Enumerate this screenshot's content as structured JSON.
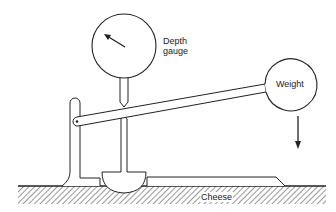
{
  "diagram": {
    "labels": {
      "depth_gauge_line1": "Depth",
      "depth_gauge_line2": "gauge",
      "weight": "Weight",
      "cheese": "Cheese"
    },
    "components": [
      {
        "name": "depth-gauge",
        "shape": "circle with needle"
      },
      {
        "name": "gauge-stem",
        "shape": "vertical rod"
      },
      {
        "name": "lever-arm",
        "shape": "inclined bar"
      },
      {
        "name": "weight",
        "shape": "circle"
      },
      {
        "name": "pivot-post",
        "shape": "vertical post with rounded top"
      },
      {
        "name": "plunger-foot",
        "shape": "half-disc"
      },
      {
        "name": "cheese-slab",
        "shape": "flat slab"
      },
      {
        "name": "ground",
        "shape": "hatched surface"
      },
      {
        "name": "force-arrow",
        "shape": "downward arrow"
      }
    ],
    "colors": {
      "stroke": "#222222",
      "background": "#ffffff"
    }
  }
}
